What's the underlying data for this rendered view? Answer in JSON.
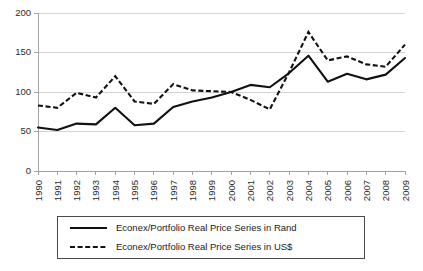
{
  "chart_data": {
    "type": "line",
    "title": "",
    "subtitle": "",
    "xlabel": "",
    "ylabel": "",
    "ylim": [
      0,
      200
    ],
    "yticks": [
      0,
      50,
      100,
      150,
      200
    ],
    "grid": true,
    "legend_position": "bottom",
    "categories": [
      "1990",
      "1991",
      "1992",
      "1993",
      "1994",
      "1995",
      "1996",
      "1997",
      "1998",
      "1999",
      "2000",
      "2001",
      "2002",
      "2003",
      "2004",
      "2005",
      "2006",
      "2007",
      "2008",
      "2009"
    ],
    "series": [
      {
        "name": "Econex/Portfolio Real Price Series in Rand",
        "style": "solid",
        "color": "#111111",
        "values": [
          55,
          52,
          60,
          59,
          80,
          58,
          60,
          81,
          88,
          93,
          100,
          109,
          106,
          124,
          146,
          113,
          123,
          116,
          122,
          143
        ]
      },
      {
        "name": "Econex/Portfolio Real Price Series in US$",
        "style": "dashed",
        "color": "#111111",
        "values": [
          83,
          80,
          99,
          93,
          120,
          88,
          85,
          110,
          102,
          101,
          100,
          90,
          78,
          125,
          176,
          140,
          145,
          135,
          132,
          160
        ]
      }
    ]
  },
  "legend": {
    "items": [
      {
        "label": "Econex/Portfolio Real Price Series in Rand",
        "style": "solid"
      },
      {
        "label": "Econex/Portfolio Real Price Series in US$",
        "style": "dashed"
      }
    ]
  },
  "axis": {
    "y_tick_labels": [
      "200",
      "150",
      "100",
      "50",
      "0"
    ],
    "x_tick_labels": [
      "1990",
      "1991",
      "1992",
      "1993",
      "1994",
      "1995",
      "1996",
      "1997",
      "1998",
      "1999",
      "2000",
      "2001",
      "2002",
      "2003",
      "2004",
      "2005",
      "2006",
      "2007",
      "2008",
      "2009"
    ]
  },
  "colors": {
    "series_stroke": "#111111",
    "gridline": "#c8c8c8",
    "axis": "#9a9a9a",
    "legend_border": "#4a4a4a",
    "background": "#ffffff"
  }
}
